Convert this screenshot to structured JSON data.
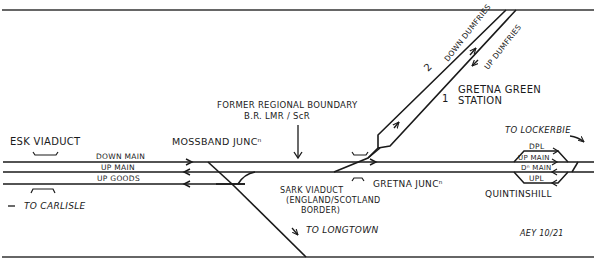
{
  "diagram": {
    "title_note": "AEY 10/21",
    "boundary": {
      "line1": "FORMER REGIONAL BOUNDARY",
      "line2": "B.R. LMR / ScR"
    },
    "places": {
      "esk_viaduct": "ESK VIADUCT",
      "mossband": "MOSSBAND JUNCⁿ",
      "gretna_junc": "GRETNA JUNCⁿ",
      "gretna_green_1": "GRETNA GREEN",
      "gretna_green_2": "STATION",
      "quintinshill": "QUINTINSHILL",
      "sark_1": "SARK VIADUCT",
      "sark_2": "(ENGLAND/SCOTLAND",
      "sark_3": "BORDER)"
    },
    "directions": {
      "to_carlisle": "TO CARLISLE",
      "to_longtown": "TO LONGTOWN",
      "to_lockerbie": "TO LOCKERBIE"
    },
    "lines": {
      "down_main": "DOWN MAIN",
      "up_main": "UP MAIN",
      "up_goods": "UP GOODS",
      "down_dumfries": "DOWN DUMFRIES",
      "up_dumfries": "UP DUMFRIES",
      "dpl": "DPL",
      "q_up_main": "UP MAIN",
      "q_dn_main": "Dⁿ MAIN",
      "upl": "UPL"
    },
    "platforms": {
      "p1": "1",
      "p2": "2"
    },
    "colors": {
      "ink": "#1a1a1a",
      "background": "#ffffff"
    }
  }
}
